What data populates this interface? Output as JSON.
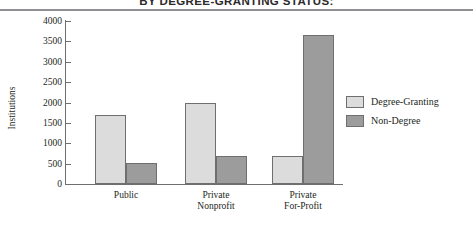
{
  "chart_data": {
    "type": "bar",
    "title": "BY DEGREE-GRANTING STATUS:",
    "xlabel": "",
    "ylabel": "Institutions",
    "categories": [
      "Public",
      "Private\nNonprofit",
      "Private\nFor-Profit"
    ],
    "series": [
      {
        "name": "Degree-Granting",
        "color": "#dcdcdc",
        "values": [
          1700,
          2000,
          690
        ]
      },
      {
        "name": "Non-Degree",
        "color": "#9c9c9c",
        "values": [
          520,
          690,
          3650
        ]
      }
    ],
    "ylim": [
      0,
      4000
    ],
    "yticks": [
      0,
      500,
      1000,
      1500,
      2000,
      2500,
      3000,
      3500,
      4000
    ],
    "ytick_labels": [
      "0",
      "500",
      "1000",
      "1500",
      "2000",
      "2500",
      "3000",
      "3500",
      "4000"
    ],
    "grid": false,
    "legend_position": "right"
  },
  "legend": {
    "items": [
      {
        "label": "Degree-Granting"
      },
      {
        "label": "Non-Degree"
      }
    ]
  },
  "colors": {
    "degree_granting": "#dcdcdc",
    "non_degree": "#9c9c9c",
    "axis": "#6e6e6e",
    "rule": "#8e9093",
    "text": "#231f20"
  }
}
